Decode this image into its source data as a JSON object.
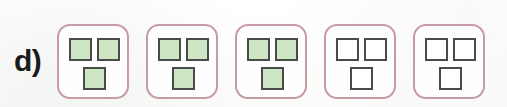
{
  "figure": {
    "item_label": "d)",
    "colors": {
      "tile_border": "#c79aa4",
      "cell_border": "#4a4a4a",
      "cell_filled": "#cfe6c4",
      "cell_empty": "#ffffff",
      "background": "#fdfdfd",
      "label_text": "#1b1b1b"
    },
    "layout": {
      "tile_count": 5,
      "cells_per_tile": 3,
      "cell_positions": [
        "top-left",
        "top-right",
        "bottom-center"
      ]
    },
    "tiles": [
      {
        "index": 1,
        "name": "tile-1",
        "filled_count": 3,
        "cells": [
          {
            "position": "top-left",
            "state": "filled"
          },
          {
            "position": "top-right",
            "state": "filled"
          },
          {
            "position": "bottom-center",
            "state": "filled"
          }
        ]
      },
      {
        "index": 2,
        "name": "tile-2",
        "filled_count": 3,
        "cells": [
          {
            "position": "top-left",
            "state": "filled"
          },
          {
            "position": "top-right",
            "state": "filled"
          },
          {
            "position": "bottom-center",
            "state": "filled"
          }
        ]
      },
      {
        "index": 3,
        "name": "tile-3",
        "filled_count": 3,
        "cells": [
          {
            "position": "top-left",
            "state": "filled"
          },
          {
            "position": "top-right",
            "state": "filled"
          },
          {
            "position": "bottom-center",
            "state": "filled"
          }
        ]
      },
      {
        "index": 4,
        "name": "tile-4",
        "filled_count": 0,
        "cells": [
          {
            "position": "top-left",
            "state": "empty"
          },
          {
            "position": "top-right",
            "state": "empty"
          },
          {
            "position": "bottom-center",
            "state": "empty"
          }
        ]
      },
      {
        "index": 5,
        "name": "tile-5",
        "filled_count": 0,
        "cells": [
          {
            "position": "top-left",
            "state": "empty"
          },
          {
            "position": "top-right",
            "state": "empty"
          },
          {
            "position": "bottom-center",
            "state": "empty"
          }
        ]
      }
    ]
  }
}
